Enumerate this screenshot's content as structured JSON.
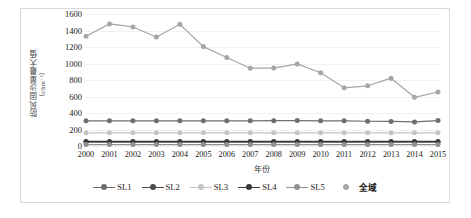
{
  "chart_data": {
    "type": "line",
    "title": "",
    "xlabel": "年份",
    "ylabel": "防风固沙量最大值",
    "ylabel_unit": "（t/hm⁻²）",
    "categories": [
      "2000",
      "2001",
      "2002",
      "2003",
      "2004",
      "2005",
      "2006",
      "2007",
      "2008",
      "2009",
      "2010",
      "2011",
      "2012",
      "2013",
      "2014",
      "2015"
    ],
    "x": [
      2000,
      2001,
      2002,
      2003,
      2004,
      2005,
      2006,
      2007,
      2008,
      2009,
      2010,
      2011,
      2012,
      2013,
      2014,
      2015
    ],
    "ylim": [
      0,
      1600
    ],
    "ytick_values": [
      0,
      200,
      400,
      600,
      800,
      1000,
      1200,
      1400,
      1600
    ],
    "ytick_labels": [
      "0",
      "200",
      "400",
      "600",
      "800",
      "1000",
      "1200",
      "1400",
      "1600"
    ],
    "grid": true,
    "grid_axis": "y",
    "legend_position": "bottom",
    "series": [
      {
        "name": "SL1",
        "color": "#6e6e6e",
        "marker": "circle",
        "values": [
          305,
          305,
          305,
          305,
          305,
          305,
          305,
          305,
          307,
          308,
          305,
          305,
          300,
          298,
          292,
          308
        ]
      },
      {
        "name": "SL2",
        "color": "#4a4a4a",
        "marker": "circle",
        "values": [
          48,
          48,
          48,
          48,
          48,
          48,
          48,
          48,
          48,
          48,
          48,
          48,
          48,
          48,
          48,
          48
        ]
      },
      {
        "name": "SL3",
        "color": "#c4c4c4",
        "marker": "circle",
        "values": [
          160,
          160,
          160,
          160,
          160,
          160,
          160,
          160,
          160,
          160,
          160,
          160,
          160,
          160,
          160,
          160
        ]
      },
      {
        "name": "SL4",
        "color": "#3a3a3a",
        "marker": "circle",
        "values": [
          55,
          55,
          55,
          55,
          55,
          55,
          55,
          55,
          55,
          55,
          55,
          55,
          55,
          55,
          55,
          55
        ]
      },
      {
        "name": "SL5",
        "color": "#909090",
        "marker": "circle",
        "values": [
          18,
          18,
          18,
          18,
          18,
          18,
          18,
          18,
          18,
          18,
          18,
          18,
          18,
          18,
          18,
          18
        ]
      },
      {
        "name": "全域",
        "color": "#a6a6a6",
        "marker": "circle",
        "values": [
          1330,
          1480,
          1443,
          1322,
          1475,
          1205,
          1072,
          943,
          945,
          995,
          888,
          705,
          730,
          822,
          590,
          655
        ]
      }
    ]
  },
  "legend": {
    "items": [
      {
        "label": "SL1",
        "bold": false
      },
      {
        "label": "SL2",
        "bold": false
      },
      {
        "label": "SL3",
        "bold": false
      },
      {
        "label": "SL4",
        "bold": false
      },
      {
        "label": "SL5",
        "bold": false
      },
      {
        "label": "全域",
        "bold": true
      }
    ]
  },
  "colors": {
    "grid": "#f1f1f1",
    "axis": "#e2e2e2",
    "frame": "#d9d9d9",
    "text": "#202020",
    "background": "#ffffff"
  }
}
